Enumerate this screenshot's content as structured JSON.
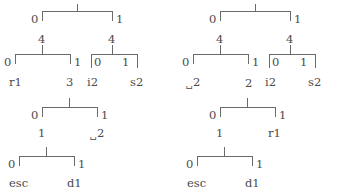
{
  "figure": {
    "line_color": "#6b6b6b",
    "text_color": "#4a4a4a",
    "background": "#ffffff"
  },
  "trees": [
    {
      "id": "left-tree",
      "name": "left-code-tree",
      "root": {
        "weight": "",
        "edge_labels": {
          "left": "0",
          "right": "1"
        },
        "children": [
          {
            "weight": "4",
            "edge_labels": {
              "left": "0",
              "right": "1"
            },
            "children": [
              {
                "leaf": "r1"
              },
              {
                "leaf": "3"
              }
            ]
          },
          {
            "weight": "4",
            "edge_labels": {
              "left": "0",
              "right": "1"
            },
            "children": [
              {
                "leaf": "i2"
              },
              {
                "leaf": "s2"
              }
            ]
          }
        ]
      },
      "subtrees": [
        {
          "id": "left-mid",
          "edge_labels": {
            "left": "0",
            "right": "1"
          },
          "children": [
            {
              "leaf": "1"
            },
            {
              "leaf": "2",
              "space_prefix": true
            }
          ]
        },
        {
          "id": "left-bottom",
          "edge_labels": {
            "left": "0",
            "right": "1"
          },
          "children": [
            {
              "leaf": "esc"
            },
            {
              "leaf": "d1"
            }
          ]
        }
      ]
    },
    {
      "id": "right-tree",
      "name": "right-code-tree",
      "root": {
        "weight": "",
        "edge_labels": {
          "left": "0",
          "right": "1"
        },
        "children": [
          {
            "weight": "4",
            "edge_labels": {
              "left": "0",
              "right": "1"
            },
            "children": [
              {
                "leaf": "2",
                "space_prefix": true
              },
              {
                "leaf": "2"
              }
            ]
          },
          {
            "weight": "4",
            "edge_labels": {
              "left": "0",
              "right": "1"
            },
            "children": [
              {
                "leaf": "i2"
              },
              {
                "leaf": "s2"
              }
            ]
          }
        ]
      },
      "subtrees": [
        {
          "id": "right-mid",
          "edge_labels": {
            "left": "0",
            "right": "1"
          },
          "children": [
            {
              "leaf": "1"
            },
            {
              "leaf": "r1"
            }
          ]
        },
        {
          "id": "right-bottom",
          "edge_labels": {
            "left": "0",
            "right": "1"
          },
          "children": [
            {
              "leaf": "esc"
            },
            {
              "leaf": "d1"
            }
          ]
        }
      ]
    }
  ],
  "labels": {
    "left": {
      "root_edge_0": "0",
      "root_edge_1": "1",
      "root_stub": "",
      "w_left": "4",
      "w_right": "4",
      "l1_edge_0": "0",
      "l1_edge_1": "1",
      "l1_leaf_0": "r1",
      "l1_leaf_1": "3",
      "r1_edge_0": "0",
      "r1_edge_1": "1",
      "r1_leaf_0": "i2",
      "r1_leaf_1": "s2",
      "mid_edge_0": "0",
      "mid_edge_1": "1",
      "mid_leaf_0": "1",
      "mid_leaf_1": "2",
      "mid_leaf_1_space": "␣",
      "bot_edge_0": "0",
      "bot_edge_1": "1",
      "bot_leaf_0": "esc",
      "bot_leaf_1": "d1"
    },
    "right": {
      "root_edge_0": "0",
      "root_edge_1": "1",
      "root_stub": "",
      "w_left": "4",
      "w_right": "4",
      "l1_edge_0": "0",
      "l1_edge_1": "1",
      "l1_leaf_0": "2",
      "l1_leaf_0_space": "␣",
      "l1_leaf_1": "2",
      "r1_edge_0": "0",
      "r1_edge_1": "1",
      "r1_leaf_0": "i2",
      "r1_leaf_1": "s2",
      "mid_edge_0": "0",
      "mid_edge_1": "1",
      "mid_leaf_0": "1",
      "mid_leaf_1": "r1",
      "bot_edge_0": "0",
      "bot_edge_1": "1",
      "bot_leaf_0": "esc",
      "bot_leaf_1": "d1"
    }
  }
}
